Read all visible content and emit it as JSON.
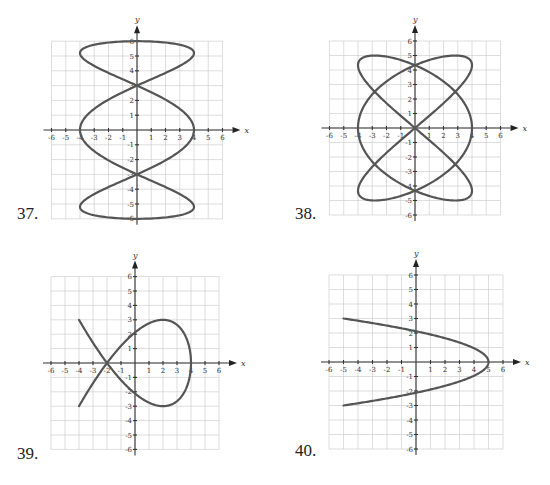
{
  "page": {
    "background": "#ffffff",
    "curve_color": "#555555",
    "grid_color": "#c8c8c8"
  },
  "problems": [
    {
      "number": "37.",
      "x_axis_label": "x",
      "y_axis_label": "y"
    },
    {
      "number": "38.",
      "x_axis_label": "x",
      "y_axis_label": "y"
    },
    {
      "number": "39.",
      "x_axis_label": "x",
      "y_axis_label": "y"
    },
    {
      "number": "40.",
      "x_axis_label": "x",
      "y_axis_label": "y"
    }
  ],
  "chart_data": [
    {
      "id": "37",
      "type": "line",
      "title": "37.",
      "xlabel": "x",
      "ylabel": "y",
      "xlim": [
        -6,
        6
      ],
      "ylim": [
        -6,
        6
      ],
      "grid": true,
      "x_ticks": [
        -6,
        -5,
        -4,
        -3,
        -2,
        -1,
        1,
        2,
        3,
        4,
        5,
        6
      ],
      "y_ticks": [
        -6,
        -5,
        -4,
        -3,
        -2,
        -1,
        1,
        2,
        3,
        4,
        5,
        6
      ],
      "parametric": "x = 4cos(3t), y = 6sin(t), 0<=t<=2pi",
      "key_points": [
        [
          0,
          6
        ],
        [
          4,
          5.3
        ],
        [
          0,
          3
        ],
        [
          4,
          0
        ],
        [
          -4,
          0
        ],
        [
          0,
          -3
        ],
        [
          -4,
          -5.3
        ],
        [
          0,
          -6
        ],
        [
          -4,
          5.3
        ],
        [
          4,
          -5.3
        ]
      ]
    },
    {
      "id": "38",
      "type": "line",
      "title": "38.",
      "xlabel": "x",
      "ylabel": "y",
      "xlim": [
        -6,
        6
      ],
      "ylim": [
        -6,
        6
      ],
      "grid": true,
      "x_ticks": [
        -6,
        -5,
        -4,
        -3,
        -2,
        -1,
        1,
        2,
        3,
        4,
        5,
        6
      ],
      "y_ticks": [
        -6,
        -5,
        -4,
        -3,
        -2,
        -1,
        1,
        2,
        3,
        4,
        5,
        6
      ],
      "parametric": "x = 4cos(3t), y = 5sin(2t), 0<=t<=2pi",
      "key_points": [
        [
          4,
          0
        ],
        [
          -4,
          0
        ],
        [
          0,
          0
        ],
        [
          0,
          4.33
        ],
        [
          0,
          -4.33
        ],
        [
          -2.83,
          5
        ],
        [
          2.83,
          5
        ],
        [
          -2.83,
          -5
        ],
        [
          2.83,
          -5
        ],
        [
          -4,
          4.33
        ],
        [
          4,
          4.33
        ],
        [
          -4,
          -4.33
        ],
        [
          4,
          -4.33
        ]
      ]
    },
    {
      "id": "39",
      "type": "line",
      "title": "39.",
      "xlabel": "x",
      "ylabel": "y",
      "xlim": [
        -6,
        6
      ],
      "ylim": [
        -6,
        6
      ],
      "grid": true,
      "x_ticks": [
        -6,
        -5,
        -4,
        -3,
        -2,
        -1,
        1,
        2,
        3,
        4,
        5,
        6
      ],
      "y_ticks": [
        -6,
        -5,
        -4,
        -3,
        -2,
        -1,
        1,
        2,
        3,
        4,
        5,
        6
      ],
      "parametric": "x = 4 - t^2, y = -0.53 t (t^2 - 6), -2.83<=t<=2.83",
      "key_points": [
        [
          -4,
          3
        ],
        [
          -2,
          0
        ],
        [
          0,
          2.1
        ],
        [
          2,
          3
        ],
        [
          4,
          0
        ],
        [
          2,
          -3
        ],
        [
          0,
          -2.1
        ],
        [
          -4,
          -3
        ]
      ]
    },
    {
      "id": "40",
      "type": "line",
      "title": "40.",
      "xlabel": "x",
      "ylabel": "y",
      "xlim": [
        -6,
        6
      ],
      "ylim": [
        -6,
        6
      ],
      "grid": true,
      "x_ticks": [
        -6,
        -5,
        -4,
        -3,
        -2,
        -1,
        1,
        2,
        3,
        4,
        5,
        6
      ],
      "y_ticks": [
        -6,
        -5,
        -4,
        -3,
        -2,
        -1,
        1,
        2,
        3,
        4,
        5,
        6
      ],
      "parametric": "x = 5 - (10/9) t^2, y = t, -3<=t<=3",
      "key_points": [
        [
          -5,
          3
        ],
        [
          0,
          2.12
        ],
        [
          5,
          0
        ],
        [
          0,
          -2.12
        ],
        [
          -5,
          -3
        ]
      ]
    }
  ]
}
